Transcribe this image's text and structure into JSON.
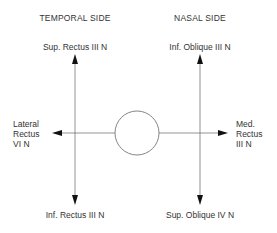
{
  "headers": {
    "temporal": "TEMPORAL SIDE",
    "nasal": "NASAL SIDE"
  },
  "muscles": {
    "top_left": "Sup. Rectus III N",
    "top_right": "Inf. Oblique III N",
    "left": [
      "Lateral",
      "Rectus",
      "VI N"
    ],
    "right": [
      "Med.",
      "Rectus",
      "III N"
    ],
    "bottom_left": "Inf. Rectus III N",
    "bottom_right": "Sup. Oblique IV N"
  },
  "colors": {
    "line": "#555555",
    "text": "#333333"
  }
}
